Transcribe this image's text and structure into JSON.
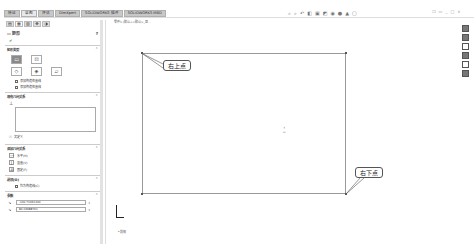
{
  "ribbon": {
    "tabs": [
      "特征",
      "草图",
      "评估",
      "DimXpert",
      "SOLIDWORKS 插件",
      "SOLIDWORKS MBD"
    ],
    "active_tab": "草图"
  },
  "heads_up": {
    "icons": [
      "zoom-fit-icon",
      "zoom-area-icon",
      "previous-view-icon",
      "section-view-icon",
      "view-orientation-icon",
      "display-style-icon",
      "hide-show-icon",
      "appearance-icon",
      "scene-icon",
      "view-settings-icon"
    ]
  },
  "window_controls": [
    "minimize",
    "restore",
    "close"
  ],
  "breadcrumb": "零件1 (默认<<默认>_显...",
  "property_manager": {
    "title": "矩形",
    "sections": {
      "rect_type": {
        "label": "矩形类型",
        "types": [
          "边角矩形",
          "中心矩形",
          "3点边角矩形",
          "3点中心矩形",
          "平行四边形"
        ],
        "checkboxes": [
          "添加构造性直线",
          "添加构造性直线"
        ]
      },
      "existing_relations": {
        "label": "现有几何关系",
        "status": "欠定义"
      },
      "add_relations": {
        "label": "添加几何关系",
        "items": [
          "水平(H)",
          "竖直(V)",
          "固定(F)"
        ]
      },
      "options": {
        "label": "选项(O)",
        "checkbox": "作为构造线(C)"
      },
      "parameters": {
        "label": "参数",
        "values": [
          "-140.71061444",
          "84.03688761"
        ]
      }
    }
  },
  "canvas": {
    "callouts": {
      "top": "右上点",
      "bottom": "右下点"
    },
    "view_label": "*前视"
  }
}
